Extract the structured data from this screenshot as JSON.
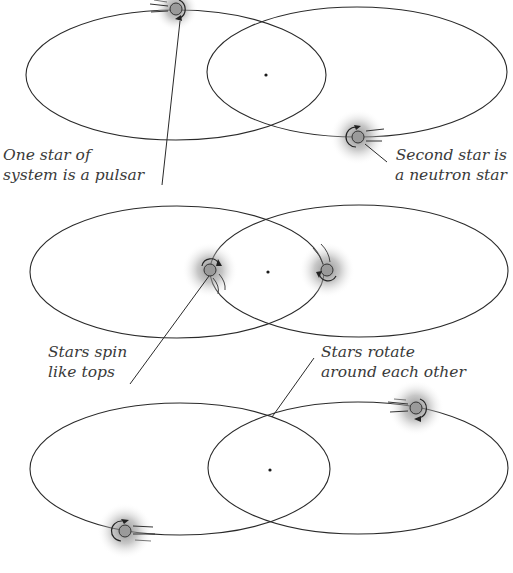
{
  "diagram": {
    "colors": {
      "line": "#2a2a2a",
      "star_fill": "#9a9a9a",
      "glow": "#8a8a8a",
      "text": "#3a3a3a",
      "background": "#ffffff"
    },
    "panels": [
      {
        "id": "panel-1",
        "annotations": [
          {
            "id": "pulsar-label",
            "lines": [
              "One star of",
              "system is a pulsar"
            ]
          },
          {
            "id": "neutron-label",
            "lines": [
              "Second star is",
              "a neutron star"
            ]
          }
        ],
        "stars": [
          {
            "role": "pulsar",
            "x": 176,
            "y": 9
          },
          {
            "role": "neutron-star",
            "x": 358,
            "y": 136
          }
        ],
        "center_of_mass": {
          "x": 266,
          "y": 75
        }
      },
      {
        "id": "panel-2",
        "annotations": [
          {
            "id": "spin-label",
            "lines": [
              "Stars spin",
              "like tops"
            ]
          },
          {
            "id": "rotate-label",
            "lines": [
              "Stars rotate",
              "around each other"
            ]
          }
        ],
        "stars": [
          {
            "role": "star-a",
            "x": 210,
            "y": 270
          },
          {
            "role": "star-b",
            "x": 327,
            "y": 270
          }
        ],
        "center_of_mass": {
          "x": 268,
          "y": 272
        }
      },
      {
        "id": "panel-3",
        "annotations": [],
        "stars": [
          {
            "role": "star-a",
            "x": 416,
            "y": 408
          },
          {
            "role": "star-b",
            "x": 125,
            "y": 531
          }
        ],
        "center_of_mass": {
          "x": 270,
          "y": 470
        }
      }
    ]
  }
}
